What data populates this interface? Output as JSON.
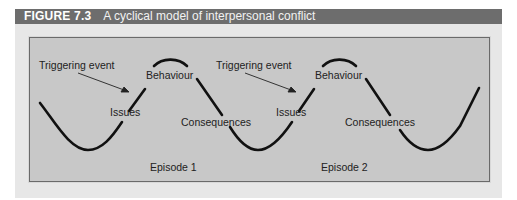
{
  "figure": {
    "number": "FIGURE 7.3",
    "title": "A cyclical model of interpersonal conflict",
    "colors": {
      "header_bg": "#6d6d6d",
      "outer_bg": "#e7e7e7",
      "panel_bg": "#c8c8c8",
      "curve": "#111111"
    }
  },
  "diagram": {
    "type": "cyclical-wave",
    "episodes": [
      {
        "label": "Episode 1",
        "trigger": "Triggering event",
        "issues": "Issues",
        "behaviour": "Behaviour",
        "consequences": "Consequences"
      },
      {
        "label": "Episode 2",
        "trigger": "Triggering event",
        "issues": "Issues",
        "behaviour": "Behaviour",
        "consequences": "Consequences"
      }
    ]
  }
}
